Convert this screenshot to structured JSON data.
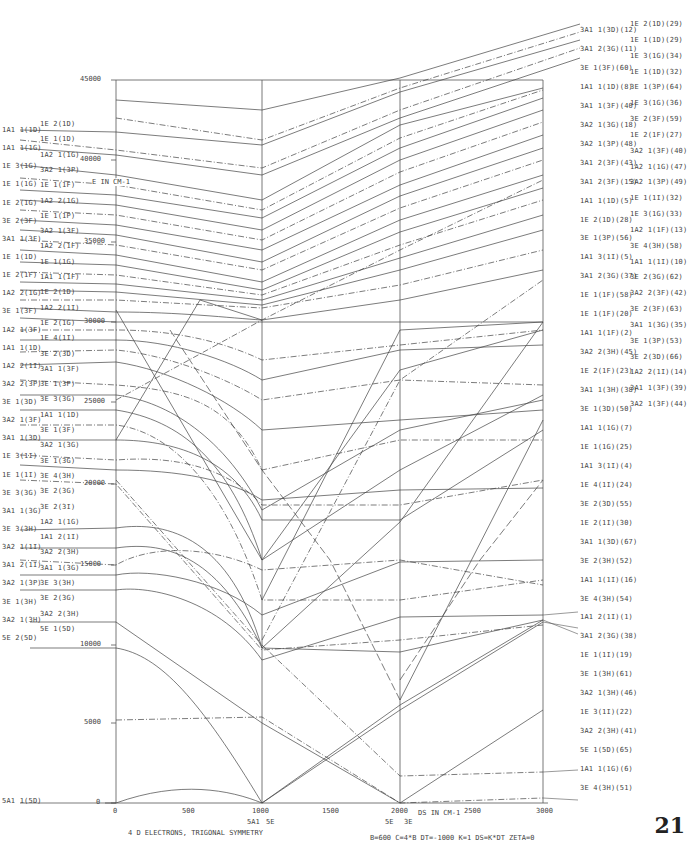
{
  "chart_data": {
    "type": "line",
    "title": "4 D ELECTRONS, TRIGONAL SYMMETRY",
    "parameters": "B=600  C=4*B  DT=-1000  K=1  DS=K*DT  ZETA=0",
    "xlabel": "DS IN CM-1",
    "ylabel": "E IN CM-1",
    "xlim": [
      0,
      3000
    ],
    "ylim": [
      0,
      45000
    ],
    "x_ticks": [
      "0",
      "500",
      "1000",
      "1500",
      "2000",
      "2500",
      "3000"
    ],
    "y_ticks": [
      "0",
      "5000",
      "10000",
      "15000",
      "20000",
      "25000",
      "30000",
      "35000",
      "40000",
      "45000"
    ],
    "grid": false,
    "vertical_markers": [
      0,
      1000,
      2000,
      3000
    ],
    "ground_state_crossings": [
      {
        "x": 1000,
        "labels": [
          "5A1",
          "5E"
        ]
      },
      {
        "x": 2000,
        "labels": [
          "5E",
          "3E"
        ]
      }
    ],
    "left_labels_col1": [
      "1A1 1(1D)",
      "1A1 1(1G)",
      "1E 3(1G)",
      "1E 1(1G)",
      "1E 2(1G)",
      "3E 2(3F)",
      "3A1 1(3F)",
      "1E 1(1D)",
      "1E 2(1F)",
      "1A2 2(1G)",
      "3E 1(3F)",
      "1A2 1(3F)",
      "1A1 1(1D)",
      "1A2 2(1I)",
      "3A2 2(3P)",
      "3E 1(3D)",
      "3A2 1(3F)",
      "3A1 1(3D)",
      "1E 3(1I)",
      "1E 1(1I)",
      "3E 3(3G)",
      "3A1 1(3G)",
      "3E 3(3H)",
      "3A2 1(1I)",
      "3A1 2(1I)",
      "3A2 1(3P)",
      "3E 1(3H)",
      "3A2 1(3H)",
      "5E 2(5D)",
      "5A1 1(5D)"
    ],
    "left_labels_col2": [
      "1E 2(1D)",
      "1E 1(1D)",
      "1A2 1(1G)",
      "3A2 1(3P)",
      "1E 1(1F)",
      "1A2 2(1G)",
      "1E 1(1P)",
      "3A2 1(3F)",
      "1A2 2(1F)",
      "1E 1(1G)",
      "1A1 1(1F)",
      "1E 2(1D)",
      "1A2 2(1I)",
      "1E 2(1G)",
      "1E 4(1I)",
      "3E 2(3D)",
      "3A1 1(3F)",
      "3E 1(3P)",
      "3E 3(3G)",
      "1A1 1(1D)",
      "3E 1(3F)",
      "3A2 1(3G)",
      "3E 1(3G)",
      "3E 4(3H)",
      "3E 2(3G)",
      "3E 2(3I)",
      "1A2 1(1G)",
      "1A1 2(1I)",
      "3A2 2(3H)",
      "3A1 1(3G)",
      "3E 3(3H)",
      "3E 2(3G)",
      "3A2 2(3H)",
      "5E 1(5D)"
    ],
    "right_labels_col1": [
      "3A1 1(3D)(12)",
      "3A1 2(3G)(11)",
      "3E 1(3F)(60)",
      "1A1 1(1D)(8)",
      "3A1 1(3F)(40)",
      "3A2 1(3G)(18)",
      "3A2 1(3P)(48)",
      "3A1 2(3F)(43)",
      "3A1 2(3F)(15)",
      "1A1 1(1D)(5)",
      "1E 2(1D)(28)",
      "3E 1(3P)(56)",
      "1A1 3(1I)(5)",
      "3A1 2(3G)(37)",
      "1E 1(1F)(58)",
      "1E 1(1F)(20)",
      "1A1 1(1F)(2)",
      "3A2 2(3H)(45)",
      "1E 2(1F)(23)",
      "3A1 1(3H)(38)",
      "3E 1(3D)(50)",
      "1A1 1(1G)(7)",
      "1E 1(1G)(25)",
      "1A1 3(1I)(4)",
      "1E 4(1I)(24)",
      "3E 2(3D)(55)",
      "1E 2(1I)(30)",
      "3A1 1(3D)(67)",
      "3E 2(3H)(52)",
      "1A1 1(1I)(16)",
      "3E 4(3H)(54)",
      "1A1 2(1I)(1)",
      "3A1 2(3G)(38)",
      "1E 1(1I)(19)",
      "3E 1(3H)(61)",
      "3A2 1(3H)(46)",
      "1E 3(1I)(22)",
      "3A2 2(3H)(41)",
      "5E 1(5D)(65)",
      "1A1 1(1G)(6)",
      "3E 4(3H)(51)"
    ],
    "right_labels_col2": [
      "1E 2(1D)(29)",
      "1E 1(1D)(29)",
      "1E 3(1G)(34)",
      "1E 1(1D)(32)",
      "3E 1(3P)(64)",
      "1E 3(1G)(36)",
      "3E 2(3F)(59)",
      "1E 2(1F)(27)",
      "3A2 1(3F)(40)",
      "1A2 1(1G)(47)",
      "3A2 1(3P)(49)",
      "1E 1(1I)(32)",
      "1E 3(1G)(33)",
      "1A2 1(1F)(13)",
      "3E 4(3H)(58)",
      "1A1 1(1I)(10)",
      "3E 2(3G)(62)",
      "3A2 2(3F)(42)",
      "3E 2(3F)(63)",
      "3A1 1(3G)(35)",
      "3E 1(3P)(53)",
      "3E 2(3D)(66)",
      "1A2 2(1I)(14)",
      "3A1 1(3F)(39)",
      "3A2 1(3F)(44)"
    ],
    "series_summary": [
      {
        "name": "5A1 1(5D)",
        "style": "solid",
        "points": [
          [
            0,
            0
          ],
          [
            1000,
            0
          ],
          [
            2000,
            5700
          ],
          [
            3000,
            11500
          ]
        ]
      },
      {
        "name": "5E 2(5D)",
        "style": "solid",
        "points": [
          [
            0,
            9600
          ],
          [
            500,
            7000
          ],
          [
            1000,
            0
          ],
          [
            2000,
            6200
          ],
          [
            3000,
            11900
          ]
        ]
      },
      {
        "name": "5E 1(5D)",
        "style": "solid",
        "points": [
          [
            0,
            11600
          ],
          [
            1000,
            5000
          ],
          [
            2000,
            0
          ],
          [
            3000,
            5800
          ]
        ]
      },
      {
        "name": "3E 4(3H)(51)",
        "style": "dashdot",
        "points": [
          [
            0,
            4800
          ],
          [
            1000,
            5300
          ],
          [
            2000,
            0
          ],
          [
            3000,
            300
          ]
        ]
      },
      {
        "name": "1A1 1(1G)(6)",
        "style": "dashdot",
        "points": [
          [
            1000,
            9900
          ],
          [
            2000,
            1700
          ],
          [
            3000,
            1800
          ]
        ]
      }
    ]
  },
  "page": {
    "number": "21"
  }
}
